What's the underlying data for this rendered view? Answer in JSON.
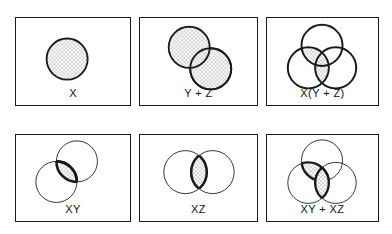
{
  "figure": {
    "kind": "venn-diagram-grid",
    "width": 392,
    "height": 234,
    "background_color": "#ffffff",
    "stroke_color": "#1a1a1a",
    "fill_pattern": "stipple-dots",
    "columns": 3,
    "rows": 2
  },
  "panels": [
    {
      "id": "panel-x",
      "label": "X",
      "box": {
        "x": 15,
        "y": 17,
        "w": 116,
        "h": 89
      },
      "outline_weight": "thick",
      "circles": [
        {
          "name": "X",
          "cx": 52,
          "cy": 42,
          "r": 21,
          "weight": "thick",
          "shaded": true
        }
      ],
      "shaded_regions": [
        "X"
      ]
    },
    {
      "id": "panel-y-plus-z",
      "label": "Y + Z",
      "box": {
        "x": 139,
        "y": 17,
        "w": 119,
        "h": 89
      },
      "outline_weight": "thick",
      "circles": [
        {
          "name": "Y",
          "cx": 50,
          "cy": 30,
          "r": 21,
          "weight": "thick",
          "shaded": true
        },
        {
          "name": "Z",
          "cx": 72,
          "cy": 52,
          "r": 21,
          "weight": "thick",
          "shaded": true
        }
      ],
      "shaded_regions": [
        "Y",
        "Z"
      ]
    },
    {
      "id": "panel-x-times-y-plus-z",
      "label": "X(Y + Z)",
      "box": {
        "x": 266,
        "y": 17,
        "w": 113,
        "h": 89
      },
      "outline_weight": "thick",
      "circles": [
        {
          "name": "Y",
          "cx": 56,
          "cy": 28,
          "r": 21,
          "weight": "thick",
          "shaded": false
        },
        {
          "name": "X",
          "cx": 42,
          "cy": 51,
          "r": 21,
          "weight": "thick",
          "shaded": false
        },
        {
          "name": "Z",
          "cx": 70,
          "cy": 51,
          "r": 21,
          "weight": "thick",
          "shaded": false
        }
      ],
      "shaded_regions": [
        "X AND Y",
        "X AND Z"
      ]
    },
    {
      "id": "panel-xy",
      "label": "XY",
      "box": {
        "x": 15,
        "y": 134,
        "w": 116,
        "h": 88
      },
      "outline_weight": "thin",
      "circles": [
        {
          "name": "Y",
          "cx": 62,
          "cy": 27,
          "r": 21,
          "weight": "thin",
          "shaded": false
        },
        {
          "name": "X",
          "cx": 41,
          "cy": 48,
          "r": 21,
          "weight": "thin",
          "shaded": false
        }
      ],
      "shaded_regions": [
        "X AND Y"
      ]
    },
    {
      "id": "panel-xz",
      "label": "XZ",
      "box": {
        "x": 139,
        "y": 134,
        "w": 119,
        "h": 88
      },
      "outline_weight": "thin",
      "circles": [
        {
          "name": "X",
          "cx": 46,
          "cy": 40,
          "r": 22,
          "weight": "thin",
          "shaded": false
        },
        {
          "name": "Z",
          "cx": 74,
          "cy": 40,
          "r": 22,
          "weight": "thin",
          "shaded": false
        }
      ],
      "shaded_regions": [
        "X AND Z"
      ]
    },
    {
      "id": "panel-xy-plus-xz",
      "label": "XY + XZ",
      "box": {
        "x": 266,
        "y": 134,
        "w": 113,
        "h": 88
      },
      "outline_weight": "thin",
      "circles": [
        {
          "name": "Y",
          "cx": 56,
          "cy": 26,
          "r": 21,
          "weight": "thin",
          "shaded": false
        },
        {
          "name": "X",
          "cx": 42,
          "cy": 49,
          "r": 21,
          "weight": "thin",
          "shaded": false
        },
        {
          "name": "Z",
          "cx": 70,
          "cy": 49,
          "r": 21,
          "weight": "thin",
          "shaded": false
        }
      ],
      "shaded_regions": [
        "X AND Y",
        "X AND Z"
      ]
    }
  ]
}
